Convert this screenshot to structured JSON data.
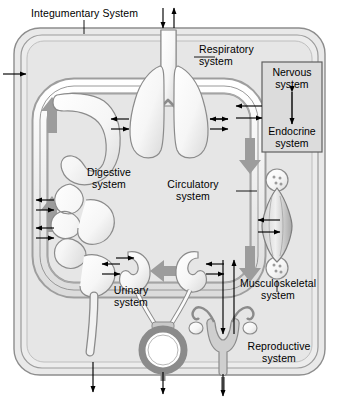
{
  "figure": {
    "type": "diagram",
    "background_color": "#ffffff",
    "body_fill_color": "#e9e9e9",
    "organ_fill_color": "#f4f4f4",
    "outline_color": "#6f6f6f",
    "arrow_color": "#000000",
    "blood_flow_arrow_color": "#9a9a9a"
  },
  "labels": {
    "integumentary": "Integumentary System",
    "respiratory": "Respiratory\nsystem",
    "nervous": "Nervous\nsystem",
    "endocrine": "Endocrine\nsystem",
    "digestive": "Digestive\nsystem",
    "circulatory": "Circulatory\nsystem",
    "urinary": "Urinary\nsystem",
    "musculoskeletal": "Musculoskeletal\nsystem",
    "reproductive": "Reproductive\nsystem"
  },
  "structures": {
    "lungs": "lungs",
    "trachea": "trachea",
    "stomach": "stomach",
    "intestines": "intestines",
    "kidney_left": "left-kidney",
    "kidney_right": "right-kidney",
    "bladder": "urinary-bladder",
    "uterus": "uterus",
    "ovary_left": "left-ovary",
    "ovary_right": "right-ovary",
    "muscle": "skeletal-muscle",
    "bone_upper": "upper-bone",
    "bone_lower": "lower-bone",
    "skin_border": "integumentary-boundary",
    "circulatory_loop": "circulatory-vessel-loop",
    "neuroendocrine_box": "nervous-endocrine-box"
  },
  "flow_arrows": {
    "trachea_in": "air-in",
    "trachea_out": "air-out",
    "blood_up_left": "blood-flow-up",
    "blood_down_right": "blood-flow-down",
    "blood_left_lower": "blood-flow-left",
    "exchange": "bidirectional-exchange",
    "excretion": "excretion-out"
  }
}
